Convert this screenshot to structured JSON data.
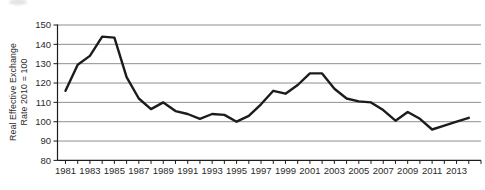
{
  "figure": {
    "background": "#ffffff",
    "note": "faint cropped smudge artifact at top-left edge"
  },
  "chart_data": {
    "type": "line",
    "title": "",
    "xlabel": "",
    "ylabel": "Real Effective Exchange Rate 2010 = 100",
    "ylabel_lines": [
      "Real Effective Exchange",
      "Rate 2010 = 100"
    ],
    "x": [
      1981,
      1982,
      1983,
      1984,
      1985,
      1986,
      1987,
      1988,
      1989,
      1990,
      1991,
      1992,
      1993,
      1994,
      1995,
      1996,
      1997,
      1998,
      1999,
      2000,
      2001,
      2002,
      2003,
      2004,
      2005,
      2006,
      2007,
      2008,
      2009,
      2010,
      2011,
      2012,
      2013,
      2014
    ],
    "series": [
      {
        "name": "Real effective exchange rate (2010 = 100)",
        "values": [
          116,
          129.5,
          134,
          144,
          143.5,
          123,
          112,
          106.5,
          110,
          105.5,
          104,
          101.5,
          104,
          103.5,
          100,
          103,
          109,
          116,
          114.5,
          119,
          125,
          125,
          117,
          112,
          110.5,
          110,
          106,
          100.5,
          105,
          101.5,
          96,
          98,
          100,
          102
        ]
      }
    ],
    "ylim": [
      80,
      150
    ],
    "ytick_step": 10,
    "ytick_labels": [
      "80",
      "90",
      "100",
      "110",
      "120",
      "130",
      "140",
      "150"
    ],
    "xaxis": {
      "start": 1981,
      "end": 2015,
      "tick_every": 1,
      "label_every": 2
    },
    "xtick_labels": [
      "1981",
      "1983",
      "1985",
      "1987",
      "1989",
      "1991",
      "1993",
      "1995",
      "1997",
      "1999",
      "2001",
      "2003",
      "2005",
      "2007",
      "2009",
      "2011",
      "2013"
    ],
    "grid": true,
    "legend": "none",
    "colors": {
      "line": "#1c1c1c",
      "grid": "#8f8f8f",
      "axis": "#1c1c1c",
      "text": "#2b2b2b"
    }
  }
}
